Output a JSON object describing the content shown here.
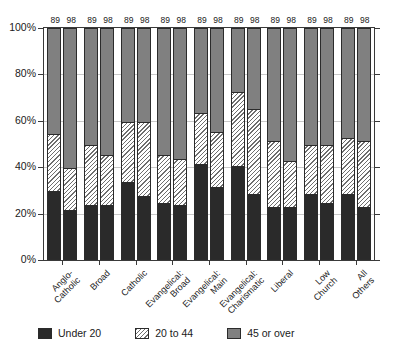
{
  "chart_data": {
    "type": "bar",
    "subtype": "100% stacked grouped bar",
    "title": "",
    "xlabel": "",
    "ylabel": "",
    "ylim": [
      0,
      100
    ],
    "ytick_labels": [
      "0%",
      "20%",
      "40%",
      "60%",
      "80%",
      "100%"
    ],
    "ytick_values": [
      0,
      20,
      40,
      60,
      80,
      100
    ],
    "grid": true,
    "legend_position": "bottom",
    "categories": [
      "Anglo-\nCatholic",
      "Broad",
      "Catholic",
      "Evangelical:\nBroad",
      "Evangelical:\nMain",
      "Evangelical:\nCharismatic",
      "Liberal",
      "Low\nChurch",
      "All\nOthers"
    ],
    "group_labels": [
      "89",
      "98"
    ],
    "series": [
      {
        "name": "Under 20",
        "color": "#2a2a2a",
        "pattern": "solid",
        "values_89": [
          29,
          23,
          33,
          24,
          41,
          40,
          22,
          28,
          28
        ],
        "values_98": [
          21,
          23,
          27,
          23,
          31,
          28,
          22,
          24,
          22
        ]
      },
      {
        "name": "20 to 44",
        "color": "#ffffff",
        "pattern": "diagonal-hatch",
        "values_89": [
          25,
          26,
          26,
          21,
          22,
          32,
          29,
          21,
          24
        ],
        "values_98": [
          18,
          22,
          32,
          20,
          24,
          37,
          20,
          25,
          29
        ]
      },
      {
        "name": "45 or over",
        "color": "#808080",
        "pattern": "solid",
        "values_89": [
          46,
          51,
          41,
          55,
          37,
          28,
          49,
          51,
          48
        ],
        "values_98": [
          61,
          55,
          41,
          57,
          45,
          35,
          58,
          51,
          49
        ]
      }
    ]
  },
  "legend": {
    "items": [
      {
        "label": "Under 20"
      },
      {
        "label": "20 to 44"
      },
      {
        "label": "45 or over"
      }
    ]
  }
}
